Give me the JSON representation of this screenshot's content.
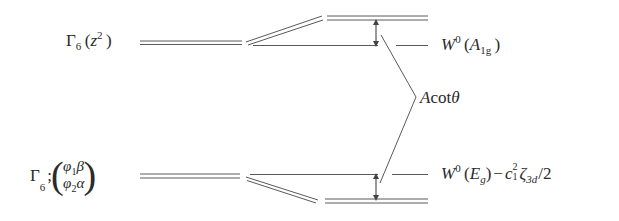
{
  "diagram": {
    "type": "energy-level-splitting",
    "colors": {
      "line": "#555555",
      "text": "#2a2a2a",
      "background": "#ffffff"
    },
    "upper_level": {
      "left_label": {
        "symbol": "Γ",
        "sub": "6",
        "orbital": "z",
        "orbital_sup": "2"
      },
      "right_label": {
        "symbol": "W",
        "sup": "0",
        "irrep": "A",
        "irrep_sub": "1g"
      }
    },
    "lower_level": {
      "left_label": {
        "symbol": "Γ",
        "sub": "6",
        "sep": ";",
        "row1_a": "φ",
        "row1_a_sub": "1",
        "row1_b": "β",
        "row2_a": "φ",
        "row2_a_sub": "2",
        "row2_b": "α"
      },
      "right_label": {
        "symbol": "W",
        "sup": "0",
        "irrep": "E",
        "irrep_sub": "g",
        "minus": "−",
        "coef": "c",
        "coef_sup": "2",
        "coef_sub": "1",
        "zeta": "ζ",
        "zeta_sub": "3d",
        "tail": "/2"
      }
    },
    "shift_label": {
      "prefix": "A",
      "func": "cot",
      "var": "θ"
    }
  }
}
